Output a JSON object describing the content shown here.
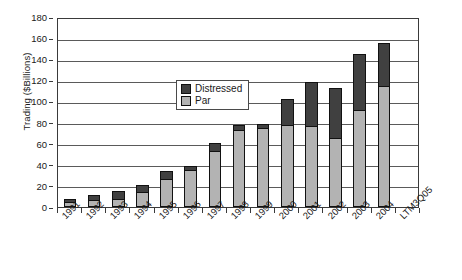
{
  "chart_data": {
    "type": "bar",
    "stacked": true,
    "title": "",
    "subtitle": "",
    "xlabel": "",
    "ylabel": "Trading ($Billions)",
    "ylim": [
      0,
      180
    ],
    "ytick_step": 20,
    "ytick_labels": [
      "180",
      "160",
      "140",
      "120",
      "100",
      "80",
      "60",
      "40",
      "20",
      "0"
    ],
    "grid": true,
    "legend_position": "inside-upper-left",
    "categories": [
      "1991",
      "1992",
      "1993",
      "1994",
      "1995",
      "1996",
      "1997",
      "1998",
      "1999",
      "2000",
      "2001",
      "2002",
      "2003",
      "2004",
      "LTM3Q05"
    ],
    "series": [
      {
        "name": "Par",
        "color": "#b3b3b3",
        "values": [
          4,
          6,
          7,
          13,
          26,
          34,
          52,
          72,
          74,
          77,
          76,
          64,
          91,
          114,
          0
        ]
      },
      {
        "name": "Distressed",
        "color": "#404040",
        "values": [
          4,
          5,
          8,
          8,
          8,
          5,
          9,
          6,
          5,
          25,
          42,
          49,
          54,
          41,
          0
        ]
      }
    ],
    "totals": [
      8,
      11,
      15,
      21,
      34,
      39,
      61,
      78,
      79,
      102,
      118,
      113,
      145,
      155,
      0
    ]
  },
  "legend": {
    "items": [
      {
        "label": "Distressed",
        "color": "#404040"
      },
      {
        "label": "Par",
        "color": "#b3b3b3"
      }
    ]
  },
  "colors": {
    "distressed": "#404040",
    "par": "#b3b3b3",
    "axis": "#3a3a3a",
    "grid": "#5a5a5a",
    "background": "#ffffff"
  }
}
